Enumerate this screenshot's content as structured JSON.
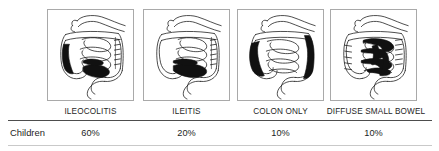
{
  "figure": {
    "panel_border_color": "#a9a9a9",
    "ink_color": "#1d1d1d",
    "lesion_color": "#111111",
    "rule_color_top": "#4d4d4d",
    "rule_color_bottom": "#c9c9c9"
  },
  "columns": [
    {
      "label": "ILEOCOLITIS",
      "illustration": "gi-tract-ileocolitis-diagram",
      "shaded_regions": [
        "ascending-colon",
        "terminal-ileum"
      ]
    },
    {
      "label": "ILEITIS",
      "illustration": "gi-tract-ileitis-diagram",
      "shaded_regions": [
        "terminal-ileum"
      ]
    },
    {
      "label": "COLON ONLY",
      "illustration": "gi-tract-colon-only-diagram",
      "shaded_regions": [
        "ascending-colon",
        "descending-colon"
      ]
    },
    {
      "label": "DIFFUSE SMALL BOWEL",
      "illustration": "gi-tract-diffuse-small-bowel-diagram",
      "shaded_regions": [
        "jejunum",
        "ileum",
        "small-bowel-loops"
      ]
    }
  ],
  "table": {
    "row_header": "Children",
    "values": [
      "60%",
      "20%",
      "10%",
      "10%"
    ]
  }
}
